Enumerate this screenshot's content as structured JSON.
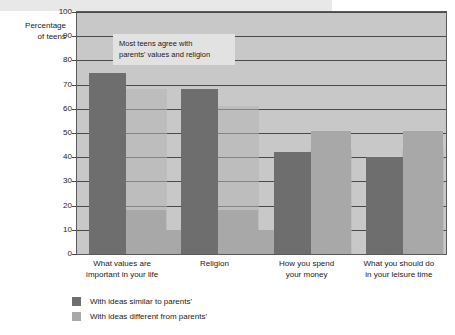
{
  "chart_data": {
    "type": "bar",
    "title": "",
    "subtitle": "",
    "xlabel": "",
    "ylabel": "Percentage of teens",
    "ylabel_line1": "Percentage",
    "ylabel_line2": "of teens",
    "ylim": [
      0,
      100
    ],
    "ytick_step": 10,
    "grid": true,
    "legend_position": "bottom-left",
    "yticks": [
      "100",
      "90",
      "80",
      "70",
      "60",
      "50",
      "40",
      "30",
      "20",
      "10",
      "0"
    ],
    "categories": [
      "What values are important in your life",
      "Religion",
      "How you spend your money",
      "What you should do in your leisure time"
    ],
    "category_lines": [
      [
        "What values are",
        "important in your life"
      ],
      [
        "Religion",
        ""
      ],
      [
        "How you spend",
        "your money"
      ],
      [
        "What you should do",
        "in your leisure time"
      ]
    ],
    "series": [
      {
        "name": "With ideas similar to parents'",
        "color": "#6e6e6e",
        "values": [
          75,
          68,
          42,
          40
        ]
      },
      {
        "name": "With ideas different from parents'",
        "color": "#a8a8a8",
        "values": [
          18,
          18,
          51,
          51
        ]
      }
    ],
    "background_bars": {
      "note": "faint overlapping bars visible behind the main series",
      "color": "#b4b4b4",
      "values": [
        68,
        61,
        43,
        43
      ]
    },
    "small_bars": {
      "color": "#a8a8a8",
      "values": [
        10,
        10,
        null,
        null
      ]
    },
    "annotation": {
      "line1": "Most teens agree with",
      "line2": "parents' values and religion",
      "background": "#e2e2e2"
    },
    "colors": {
      "plot_background": "#c8c8c8",
      "gridline": "#4a4a4a",
      "border": "#5a5a5a",
      "text": "#1a1a1a",
      "page_background": "#ffffff",
      "top_strip": "#e8e8e8"
    }
  }
}
